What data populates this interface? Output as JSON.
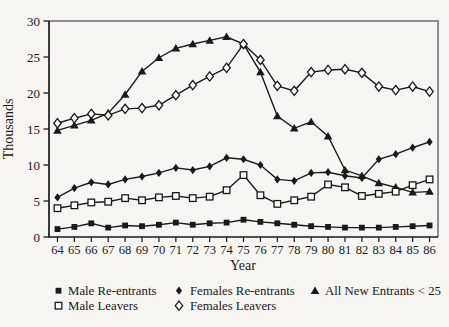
{
  "figure": {
    "background": "#f6f5f2",
    "paper": "#fbfaf8",
    "ink": "#1a1a1a",
    "frame_gray": "#8f8f8f"
  },
  "chart_data": {
    "type": "line",
    "title": "",
    "xlabel": "Year",
    "ylabel": "Thousands",
    "ylim": [
      0,
      30
    ],
    "yticks": [
      0,
      5,
      10,
      15,
      20,
      25,
      30
    ],
    "x": [
      64,
      65,
      66,
      67,
      68,
      69,
      70,
      71,
      72,
      73,
      74,
      75,
      76,
      77,
      78,
      79,
      80,
      81,
      82,
      83,
      84,
      85,
      86
    ],
    "grid": false,
    "legend_position": "bottom",
    "series": [
      {
        "name": "All New Entrants < 25",
        "marker": "triangle-filled",
        "legend_row": 0,
        "legend_col": 2,
        "values": [
          14.8,
          15.5,
          16.2,
          17.2,
          19.8,
          23.0,
          24.9,
          26.2,
          26.8,
          27.3,
          27.8,
          26.8,
          22.9,
          16.8,
          15.1,
          16.0,
          14.0,
          9.3,
          8.5,
          7.5,
          6.9,
          6.2,
          6.3
        ]
      },
      {
        "name": "Females Re-entrants",
        "marker": "diamond-filled",
        "legend_row": 0,
        "legend_col": 1,
        "values": [
          5.5,
          6.8,
          7.6,
          7.3,
          8.0,
          8.4,
          8.9,
          9.6,
          9.3,
          9.8,
          11.0,
          10.8,
          10.0,
          8.0,
          7.8,
          8.9,
          9.0,
          8.5,
          8.2,
          10.8,
          11.5,
          12.4,
          13.2
        ]
      },
      {
        "name": "Male Re-entrants",
        "marker": "square-filled",
        "legend_row": 0,
        "legend_col": 0,
        "values": [
          1.1,
          1.4,
          1.9,
          1.3,
          1.6,
          1.5,
          1.7,
          2.0,
          1.7,
          1.9,
          2.0,
          2.4,
          2.1,
          1.9,
          1.7,
          1.5,
          1.4,
          1.3,
          1.3,
          1.3,
          1.4,
          1.5,
          1.6
        ]
      },
      {
        "name": "Male Leavers",
        "marker": "square-open",
        "legend_row": 1,
        "legend_col": 0,
        "values": [
          4.0,
          4.4,
          4.8,
          4.9,
          5.4,
          5.1,
          5.5,
          5.7,
          5.4,
          5.6,
          6.5,
          8.6,
          5.8,
          4.6,
          5.1,
          5.6,
          7.3,
          6.9,
          5.7,
          6.0,
          6.3,
          7.2,
          8.0
        ]
      },
      {
        "name": "Females Leavers",
        "marker": "diamond-open",
        "legend_row": 1,
        "legend_col": 1,
        "values": [
          15.8,
          16.5,
          17.1,
          16.9,
          17.8,
          17.9,
          18.3,
          19.7,
          21.1,
          22.3,
          23.5,
          26.8,
          24.6,
          21.0,
          20.3,
          22.9,
          23.2,
          23.3,
          22.8,
          20.9,
          20.4,
          20.9,
          20.2
        ]
      }
    ]
  }
}
